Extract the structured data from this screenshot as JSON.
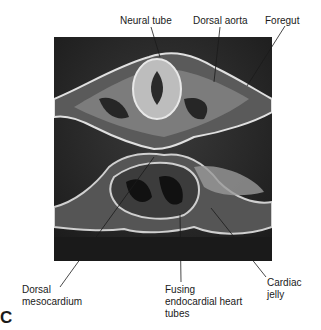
{
  "figure": {
    "panel_label": "C",
    "image_description": "Scanning electron micrograph of embryonic cross-section showing fusing endocardial heart tubes",
    "labels": {
      "neural_tube": "Neural tube",
      "dorsal_aorta": "Dorsal aorta",
      "foregut": "Foregut",
      "dorsal_mesocardium_1": "Dorsal",
      "dorsal_mesocardium_2": "mesocardium",
      "fusing_1": "Fusing",
      "fusing_2": "endocardial heart",
      "fusing_3": "tubes",
      "cardiac_1": "Cardiac",
      "cardiac_2": "jelly"
    }
  }
}
